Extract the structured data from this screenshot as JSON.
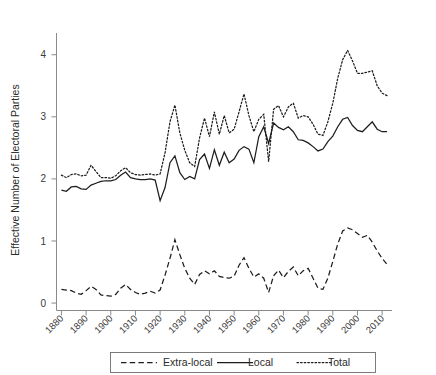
{
  "chart_data": {
    "type": "line",
    "title": "",
    "xlabel": "",
    "ylabel": "Effective Number of Electoral Parties",
    "xlim": [
      1878,
      2014
    ],
    "ylim": [
      -0.12,
      4.35
    ],
    "grid": false,
    "legend_position": "bottom-outside",
    "x_ticks": [
      1880,
      1890,
      1900,
      1910,
      1920,
      1930,
      1940,
      1950,
      1960,
      1970,
      1980,
      1990,
      2000,
      2010
    ],
    "x_tick_labels": [
      "1880",
      "1890",
      "1900",
      "1910",
      "1920",
      "1930",
      "1940",
      "1950",
      "1960",
      "1970",
      "1980",
      "1990",
      "2000",
      "2010"
    ],
    "y_ticks": [
      0,
      1,
      2,
      3,
      4
    ],
    "y_tick_labels": [
      "0",
      "1",
      "2",
      "3",
      "4"
    ],
    "x": [
      1880,
      1882,
      1884,
      1886,
      1888,
      1890,
      1892,
      1894,
      1896,
      1898,
      1900,
      1902,
      1904,
      1906,
      1908,
      1910,
      1912,
      1914,
      1916,
      1918,
      1920,
      1922,
      1924,
      1926,
      1928,
      1930,
      1932,
      1934,
      1936,
      1938,
      1940,
      1942,
      1944,
      1946,
      1948,
      1950,
      1952,
      1954,
      1956,
      1958,
      1960,
      1962,
      1964,
      1966,
      1968,
      1970,
      1972,
      1974,
      1976,
      1978,
      1980,
      1982,
      1984,
      1986,
      1988,
      1990,
      1992,
      1994,
      1996,
      1998,
      2000,
      2002,
      2004,
      2006,
      2008,
      2010,
      2012
    ],
    "series": [
      {
        "name": "Extra-local",
        "style": "dashed",
        "color": "#1d1d1d",
        "values": [
          0.22,
          0.21,
          0.2,
          0.16,
          0.14,
          0.2,
          0.27,
          0.22,
          0.13,
          0.12,
          0.11,
          0.14,
          0.24,
          0.3,
          0.22,
          0.17,
          0.14,
          0.16,
          0.19,
          0.16,
          0.21,
          0.45,
          0.72,
          1.02,
          0.78,
          0.56,
          0.4,
          0.3,
          0.46,
          0.52,
          0.47,
          0.52,
          0.43,
          0.41,
          0.4,
          0.43,
          0.61,
          0.73,
          0.56,
          0.42,
          0.47,
          0.4,
          0.17,
          0.44,
          0.53,
          0.41,
          0.51,
          0.58,
          0.44,
          0.52,
          0.56,
          0.4,
          0.24,
          0.22,
          0.4,
          0.67,
          0.95,
          1.16,
          1.21,
          1.18,
          1.12,
          1.06,
          1.09,
          0.98,
          0.84,
          0.72,
          0.62
        ]
      },
      {
        "name": "Local",
        "style": "solid",
        "color": "#1d1d1d",
        "values": [
          1.82,
          1.8,
          1.87,
          1.88,
          1.84,
          1.83,
          1.9,
          1.93,
          1.96,
          1.97,
          1.97,
          1.99,
          2.06,
          2.11,
          2.02,
          2.0,
          1.99,
          1.99,
          2.0,
          1.98,
          1.65,
          1.86,
          2.26,
          2.37,
          2.1,
          1.99,
          2.04,
          2.0,
          2.31,
          2.4,
          2.17,
          2.47,
          2.22,
          2.43,
          2.26,
          2.32,
          2.46,
          2.52,
          2.48,
          2.26,
          2.68,
          2.84,
          2.57,
          2.9,
          2.83,
          2.79,
          2.84,
          2.76,
          2.63,
          2.62,
          2.58,
          2.52,
          2.45,
          2.48,
          2.6,
          2.69,
          2.84,
          2.96,
          2.99,
          2.86,
          2.78,
          2.76,
          2.84,
          2.92,
          2.8,
          2.76,
          2.76
        ]
      },
      {
        "name": "Total",
        "style": "dotted",
        "color": "#1d1d1d",
        "values": [
          2.06,
          2.02,
          2.07,
          2.08,
          2.05,
          2.06,
          2.22,
          2.12,
          2.02,
          2.02,
          2.01,
          2.05,
          2.13,
          2.18,
          2.1,
          2.07,
          2.06,
          2.07,
          2.08,
          2.06,
          2.08,
          2.42,
          2.92,
          3.19,
          2.74,
          2.46,
          2.26,
          2.2,
          2.66,
          2.98,
          2.68,
          3.08,
          2.72,
          3.02,
          2.74,
          2.8,
          3.08,
          3.37,
          3.02,
          2.76,
          2.96,
          3.04,
          2.28,
          3.12,
          3.18,
          3.0,
          3.16,
          3.22,
          2.98,
          3.02,
          3.0,
          2.88,
          2.72,
          2.7,
          2.92,
          3.22,
          3.62,
          3.92,
          4.07,
          3.9,
          3.7,
          3.7,
          3.72,
          3.74,
          3.5,
          3.38,
          3.34
        ]
      }
    ],
    "legend": [
      {
        "label": "Extra-local",
        "style": "dashed"
      },
      {
        "label": "Local",
        "style": "solid"
      },
      {
        "label": "Total",
        "style": "dotted"
      }
    ]
  }
}
